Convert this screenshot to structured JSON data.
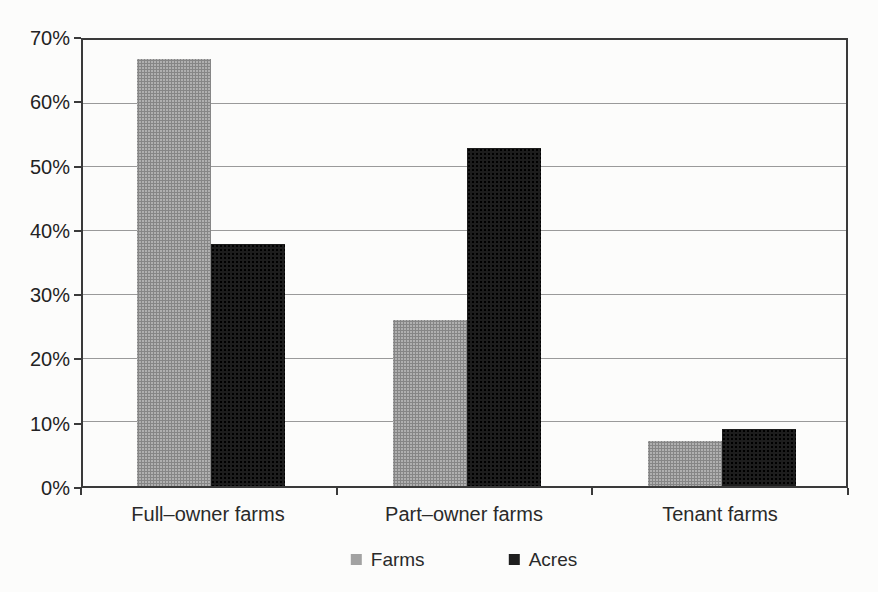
{
  "chart_data": {
    "type": "bar",
    "title": "",
    "xlabel": "",
    "ylabel": "",
    "categories": [
      "Full–owner farms",
      "Part–owner farms",
      "Tenant farms"
    ],
    "series": [
      {
        "name": "Farms",
        "color": "#a8a8a8",
        "values": [
          67,
          26,
          7
        ]
      },
      {
        "name": "Acres",
        "color": "#1d1d1d",
        "values": [
          38,
          53,
          9
        ]
      }
    ],
    "ylim": [
      0,
      70
    ],
    "ytick_step": 10,
    "ytick_labels": [
      "0%",
      "10%",
      "20%",
      "30%",
      "40%",
      "50%",
      "60%",
      "70%"
    ],
    "grid": true,
    "legend_position": "bottom"
  }
}
